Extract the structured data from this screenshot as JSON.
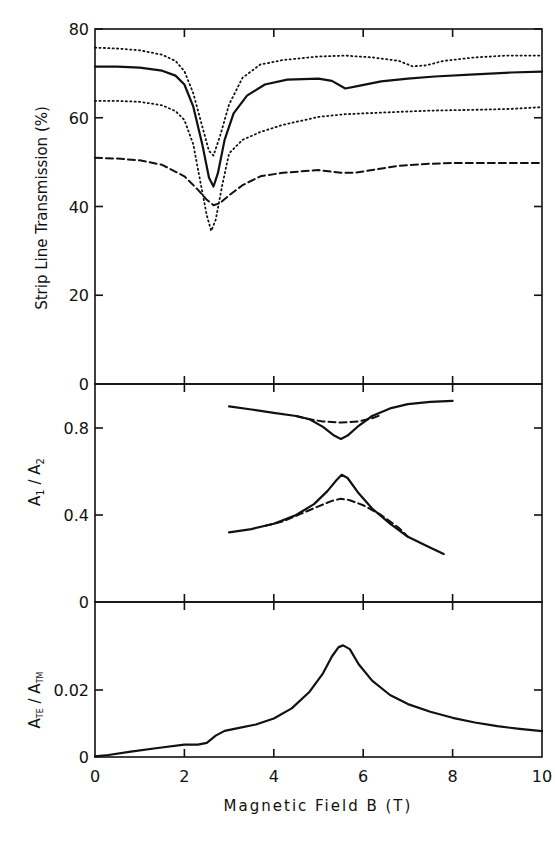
{
  "chart_data": [
    {
      "type": "line",
      "panel": "top",
      "title": "",
      "xlabel": "Magnetic Field B (T)",
      "ylabel": "Strip Line Transmission (%)",
      "xlim": [
        0,
        10
      ],
      "ylim": [
        0,
        80
      ],
      "yticks": [
        0,
        20,
        40,
        60,
        80
      ],
      "ytick_labels": [
        "0",
        "20",
        "40",
        "60",
        "80"
      ],
      "grid": false,
      "series": [
        {
          "name": "dotted-upper",
          "style": "dotted",
          "x": [
            0,
            0.5,
            1,
            1.5,
            1.8,
            2.0,
            2.2,
            2.4,
            2.55,
            2.65,
            2.8,
            3.0,
            3.3,
            3.7,
            4.2,
            5.0,
            5.6,
            6.2,
            6.8,
            7.1,
            7.4,
            7.8,
            8.5,
            9.2,
            10
          ],
          "y": [
            75.8,
            75.6,
            75.2,
            74.2,
            72.8,
            70.5,
            65.5,
            58,
            52.5,
            51.5,
            56,
            63,
            69,
            72,
            73,
            73.8,
            74,
            73.6,
            72.8,
            71.6,
            71.8,
            72.8,
            73.6,
            74,
            74
          ]
        },
        {
          "name": "solid",
          "style": "solid",
          "x": [
            0,
            0.5,
            1,
            1.5,
            1.8,
            2.0,
            2.2,
            2.4,
            2.55,
            2.65,
            2.75,
            2.9,
            3.1,
            3.4,
            3.8,
            4.3,
            5.0,
            5.3,
            5.6,
            5.9,
            6.4,
            7.0,
            7.6,
            8.5,
            9.3,
            10
          ],
          "y": [
            71.5,
            71.5,
            71.3,
            70.6,
            69.5,
            67.5,
            62.5,
            54,
            46.5,
            44.5,
            47.5,
            55,
            61,
            65,
            67.5,
            68.6,
            68.8,
            68.3,
            66.6,
            67.2,
            68.2,
            68.8,
            69.3,
            69.8,
            70.2,
            70.4
          ]
        },
        {
          "name": "dotted-lower",
          "style": "dotted",
          "x": [
            0,
            0.5,
            1,
            1.5,
            1.8,
            2.0,
            2.2,
            2.35,
            2.5,
            2.6,
            2.7,
            2.85,
            3.0,
            3.3,
            3.7,
            4.2,
            5.0,
            5.6,
            6.5,
            7.5,
            8.5,
            9.3,
            10
          ],
          "y": [
            63.8,
            63.8,
            63.6,
            62.8,
            61.5,
            59.5,
            54,
            46,
            38,
            34.5,
            37,
            45,
            52,
            55,
            56.8,
            58.4,
            60.2,
            60.8,
            61.2,
            61.6,
            61.8,
            62,
            62.4
          ]
        },
        {
          "name": "dashed",
          "style": "dashed",
          "x": [
            0,
            0.5,
            1,
            1.5,
            2.0,
            2.3,
            2.5,
            2.65,
            2.8,
            3.0,
            3.3,
            3.7,
            4.2,
            5.0,
            5.5,
            5.8,
            6.2,
            6.8,
            7.4,
            8.0,
            9.0,
            10
          ],
          "y": [
            51,
            50.8,
            50.4,
            49.4,
            46.8,
            43.8,
            41.5,
            40.3,
            40.8,
            42.5,
            44.8,
            46.8,
            47.6,
            48.2,
            47.6,
            47.6,
            48.2,
            49.2,
            49.6,
            49.8,
            49.8,
            49.8
          ]
        }
      ]
    },
    {
      "type": "line",
      "panel": "middle",
      "xlabel": "Magnetic Field B (T)",
      "ylabel": "A1/A2",
      "xlim": [
        0,
        10
      ],
      "ylim": [
        0,
        0.95
      ],
      "yticks": [
        0,
        0.4,
        0.8
      ],
      "ytick_labels": [
        "0",
        "0.4",
        "0.8"
      ],
      "grid": false,
      "series": [
        {
          "name": "upper-solid",
          "style": "solid",
          "x": [
            3.0,
            3.5,
            4.0,
            4.5,
            4.8,
            5.1,
            5.35,
            5.5,
            5.65,
            5.9,
            6.2,
            6.6,
            7.0,
            7.5,
            8.0
          ],
          "y": [
            0.9,
            0.885,
            0.87,
            0.855,
            0.84,
            0.805,
            0.765,
            0.75,
            0.765,
            0.81,
            0.855,
            0.89,
            0.91,
            0.92,
            0.925
          ]
        },
        {
          "name": "upper-dashed",
          "style": "dashed",
          "x": [
            4.5,
            4.8,
            5.1,
            5.5,
            5.9,
            6.2,
            6.4
          ],
          "y": [
            0.855,
            0.84,
            0.83,
            0.825,
            0.83,
            0.845,
            0.86
          ]
        },
        {
          "name": "lower-solid",
          "style": "solid",
          "x": [
            3.0,
            3.5,
            4.0,
            4.5,
            4.9,
            5.2,
            5.4,
            5.52,
            5.65,
            5.9,
            6.2,
            6.6,
            7.0,
            7.4,
            7.8
          ],
          "y": [
            0.32,
            0.335,
            0.36,
            0.4,
            0.45,
            0.51,
            0.56,
            0.585,
            0.57,
            0.5,
            0.43,
            0.36,
            0.3,
            0.26,
            0.22
          ]
        },
        {
          "name": "lower-dashed",
          "style": "dashed",
          "x": [
            3.8,
            4.2,
            4.6,
            5.0,
            5.3,
            5.5,
            5.7,
            6.0,
            6.4,
            6.8,
            7.0
          ],
          "y": [
            0.35,
            0.37,
            0.405,
            0.44,
            0.465,
            0.475,
            0.468,
            0.445,
            0.4,
            0.34,
            0.3
          ]
        }
      ]
    },
    {
      "type": "line",
      "panel": "bottom",
      "xlabel": "Magnetic Field B (T)",
      "ylabel": "ATE/ATM",
      "xlim": [
        0,
        10
      ],
      "ylim": [
        0,
        0.035
      ],
      "yticks": [
        0,
        0.02
      ],
      "ytick_labels": [
        "0",
        "0.02"
      ],
      "xticks": [
        0,
        2,
        4,
        6,
        8,
        10
      ],
      "xtick_labels": [
        "0",
        "2",
        "4",
        "6",
        "8",
        "10"
      ],
      "grid": false,
      "series": [
        {
          "name": "solid",
          "style": "solid",
          "x": [
            0,
            0.3,
            0.8,
            1.4,
            2.0,
            2.3,
            2.5,
            2.7,
            2.9,
            3.2,
            3.6,
            4.0,
            4.4,
            4.8,
            5.1,
            5.3,
            5.45,
            5.55,
            5.7,
            5.9,
            6.2,
            6.6,
            7.0,
            7.5,
            8.0,
            8.5,
            9.0,
            9.5,
            10
          ],
          "y": [
            0.0002,
            0.0006,
            0.0016,
            0.0027,
            0.0037,
            0.0037,
            0.0042,
            0.0064,
            0.0078,
            0.0086,
            0.0097,
            0.0115,
            0.0145,
            0.0195,
            0.025,
            0.03,
            0.0328,
            0.0333,
            0.0322,
            0.0277,
            0.0228,
            0.0185,
            0.0158,
            0.0135,
            0.0117,
            0.0103,
            0.0092,
            0.0084,
            0.0077
          ]
        }
      ]
    }
  ],
  "labels": {
    "top_ylabel": "Strip Line Transmission  (%)",
    "middle_ylabel_main": "A",
    "middle_ylabel_sub1": "1",
    "middle_ylabel_sep": " / A",
    "middle_ylabel_sub2": "2",
    "bottom_ylabel_main": "A",
    "bottom_ylabel_sub1": "TE",
    "bottom_ylabel_sep": " / A",
    "bottom_ylabel_sub2": "TM",
    "xlabel": "Magnetic Field  B  (T)"
  }
}
